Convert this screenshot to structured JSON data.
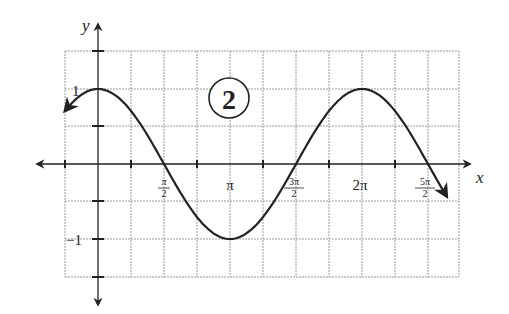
{
  "chart_data": {
    "type": "line",
    "title": "",
    "badge": "2",
    "function": "y = cos(x)",
    "xlabel": "x",
    "ylabel": "y",
    "xlim": [
      "-π/4",
      "11π/4"
    ],
    "ylim": [
      -1.5,
      1.5
    ],
    "grid": true,
    "x_ticks": [
      {
        "value": 1.5708,
        "label_num": "π",
        "label_den": "2"
      },
      {
        "value": 3.1416,
        "label": "π"
      },
      {
        "value": 4.7124,
        "label_num": "3π",
        "label_den": "2"
      },
      {
        "value": 6.2832,
        "label": "2π"
      },
      {
        "value": 7.854,
        "label_num": "5π",
        "label_den": "2"
      }
    ],
    "y_ticks": [
      {
        "value": 1,
        "label": "1"
      },
      {
        "value": -1,
        "label": "−1"
      }
    ],
    "series": [
      {
        "name": "cos(x)",
        "x": [
          -0.785,
          0,
          0.785,
          1.571,
          2.356,
          3.142,
          3.927,
          4.712,
          5.498,
          6.283,
          7.069,
          7.854,
          8.3
        ],
        "y": [
          0.707,
          1,
          0.707,
          0,
          -0.707,
          -1,
          -0.707,
          0,
          0.707,
          1,
          0.707,
          0,
          -0.43
        ]
      }
    ],
    "arrows": {
      "left_end": true,
      "right_end": true
    }
  },
  "labels": {
    "x_axis": "x",
    "y_axis": "y",
    "y_one": "1",
    "y_neg_one": "−1",
    "pi": "π",
    "two_pi": "2π",
    "half_num": "π",
    "half_den": "2",
    "three_half_num": "3π",
    "three_half_den": "2",
    "five_half_num": "5π",
    "five_half_den": "2",
    "badge": "2"
  }
}
